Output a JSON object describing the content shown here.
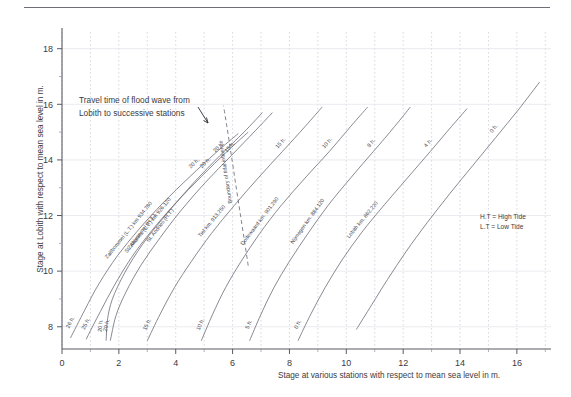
{
  "figure": {
    "top_rule": true,
    "annotation": {
      "line1": "Travel time of flood wave from",
      "line2": "Lobith to successive stations"
    },
    "tidal_boundary_label": "Boundary of tidal influence",
    "legend": {
      "line1": "H.T =  High Tide",
      "line2": "L.T =  Low Tide"
    }
  },
  "chart_data": {
    "type": "line",
    "title": "",
    "xlabel": "Stage at various stations with respect to mean sea level in m.",
    "ylabel": "Stage at Lobith with respect to mean sea level in m.",
    "xlim": [
      0,
      17.2
    ],
    "ylim": [
      7.2,
      18.6
    ],
    "xticks": [
      0,
      2,
      4,
      6,
      8,
      10,
      12,
      14,
      16
    ],
    "yticks": [
      8,
      10,
      12,
      14,
      16,
      18
    ],
    "xtick_labels": [
      "0",
      "2",
      "4",
      "6",
      "8",
      "10",
      "12",
      "14",
      "16"
    ],
    "ytick_labels": [
      "8",
      "10",
      "12",
      "14",
      "16",
      "18"
    ],
    "grid": "vertical-dashed",
    "legend_position": "right-middle",
    "series": [
      {
        "name": "Zaltbommel (L.T.) km 934.780",
        "travel_time": "20 h.",
        "travel_time_bottom": "26 h.",
        "style": "solid",
        "points": [
          [
            0.3,
            7.6
          ],
          [
            0.8,
            8.6
          ],
          [
            1.3,
            9.55
          ],
          [
            1.95,
            10.55
          ],
          [
            2.7,
            11.5
          ],
          [
            3.55,
            12.45
          ],
          [
            4.5,
            13.4
          ],
          [
            5.4,
            14.25
          ],
          [
            6.2,
            14.95
          ]
        ]
      },
      {
        "name": "Zaltbommel (H.T.)",
        "travel_time": "20 h.",
        "travel_time_bottom": "25 h.",
        "style": "solid",
        "points": [
          [
            0.85,
            7.55
          ],
          [
            1.35,
            8.55
          ],
          [
            1.85,
            9.5
          ],
          [
            2.45,
            10.5
          ],
          [
            3.15,
            11.45
          ],
          [
            4.0,
            12.45
          ],
          [
            4.9,
            13.4
          ],
          [
            5.8,
            14.3
          ],
          [
            6.55,
            15.0
          ]
        ]
      },
      {
        "name": "St. Andries (L.T.) km 926.120",
        "travel_time": "20 h.",
        "travel_time_bottom": "20 h.",
        "style": "solid",
        "points": [
          [
            1.55,
            7.5
          ],
          [
            1.62,
            8.4
          ],
          [
            1.85,
            9.2
          ],
          [
            2.35,
            10.2
          ],
          [
            3.0,
            11.2
          ],
          [
            3.8,
            12.2
          ],
          [
            4.65,
            13.2
          ],
          [
            5.55,
            14.15
          ],
          [
            6.4,
            15.0
          ],
          [
            7.05,
            15.7
          ]
        ]
      },
      {
        "name": "St. Andries (H.T.)",
        "travel_time": "15 h.",
        "travel_time_bottom": "20 h.",
        "style": "solid",
        "points": [
          [
            1.7,
            7.5
          ],
          [
            1.9,
            8.4
          ],
          [
            2.25,
            9.25
          ],
          [
            2.8,
            10.25
          ],
          [
            3.45,
            11.2
          ],
          [
            4.2,
            12.2
          ],
          [
            5.05,
            13.2
          ],
          [
            5.95,
            14.15
          ],
          [
            6.8,
            15.05
          ],
          [
            7.4,
            15.7
          ]
        ]
      },
      {
        "name": "Tiel km. 913.250",
        "travel_time": "15 h.",
        "travel_time_bottom": "15 h.",
        "style": "solid",
        "points": [
          [
            3.0,
            7.5
          ],
          [
            3.45,
            8.45
          ],
          [
            3.95,
            9.4
          ],
          [
            4.55,
            10.35
          ],
          [
            5.25,
            11.35
          ],
          [
            6.05,
            12.35
          ],
          [
            6.9,
            13.35
          ],
          [
            7.75,
            14.3
          ],
          [
            8.55,
            15.2
          ],
          [
            9.15,
            15.9
          ]
        ]
      },
      {
        "name": "Dodewaard  km. 901.290",
        "travel_time": "10 h.",
        "travel_time_bottom": "10 h.",
        "style": "solid",
        "points": [
          [
            4.9,
            7.5
          ],
          [
            5.3,
            8.45
          ],
          [
            5.75,
            9.4
          ],
          [
            6.3,
            10.35
          ],
          [
            6.95,
            11.35
          ],
          [
            7.7,
            12.35
          ],
          [
            8.55,
            13.35
          ],
          [
            9.4,
            14.3
          ],
          [
            10.15,
            15.2
          ],
          [
            10.75,
            15.9
          ]
        ]
      },
      {
        "name": "Nijmegen  km. 884.120",
        "travel_time": "8 h.",
        "travel_time_bottom": "5 h.",
        "style": "solid",
        "points": [
          [
            6.6,
            7.5
          ],
          [
            7.0,
            8.45
          ],
          [
            7.45,
            9.4
          ],
          [
            8.0,
            10.35
          ],
          [
            8.65,
            11.35
          ],
          [
            9.35,
            12.35
          ],
          [
            10.15,
            13.35
          ],
          [
            10.95,
            14.3
          ],
          [
            11.7,
            15.2
          ],
          [
            12.25,
            15.9
          ]
        ]
      },
      {
        "name": "Lobith  km. 862.220",
        "travel_time": "4 h.",
        "travel_time_bottom": "0 h.",
        "style": "solid",
        "points": [
          [
            8.3,
            7.5
          ],
          [
            8.75,
            8.45
          ],
          [
            9.25,
            9.4
          ],
          [
            9.85,
            10.4
          ],
          [
            10.55,
            11.4
          ],
          [
            11.35,
            12.4
          ],
          [
            12.15,
            13.35
          ],
          [
            12.95,
            14.3
          ],
          [
            13.7,
            15.2
          ],
          [
            14.25,
            15.85
          ]
        ]
      },
      {
        "name": "rightmost",
        "travel_time": "0 h.",
        "travel_time_bottom": "",
        "style": "solid",
        "points": [
          [
            10.35,
            7.9
          ],
          [
            10.9,
            8.8
          ],
          [
            11.45,
            9.7
          ],
          [
            12.1,
            10.7
          ],
          [
            12.85,
            11.75
          ],
          [
            13.65,
            12.8
          ],
          [
            14.45,
            13.8
          ],
          [
            15.25,
            14.8
          ],
          [
            16.05,
            15.8
          ],
          [
            16.8,
            16.8
          ]
        ]
      },
      {
        "name": "Boundary of tidal influence",
        "travel_time": "",
        "travel_time_bottom": "",
        "style": "dashed",
        "points": [
          [
            6.55,
            10.2
          ],
          [
            6.4,
            11.2
          ],
          [
            6.25,
            12.2
          ],
          [
            6.1,
            13.2
          ],
          [
            5.95,
            14.2
          ],
          [
            5.8,
            15.2
          ],
          [
            5.68,
            15.95
          ]
        ]
      }
    ]
  }
}
